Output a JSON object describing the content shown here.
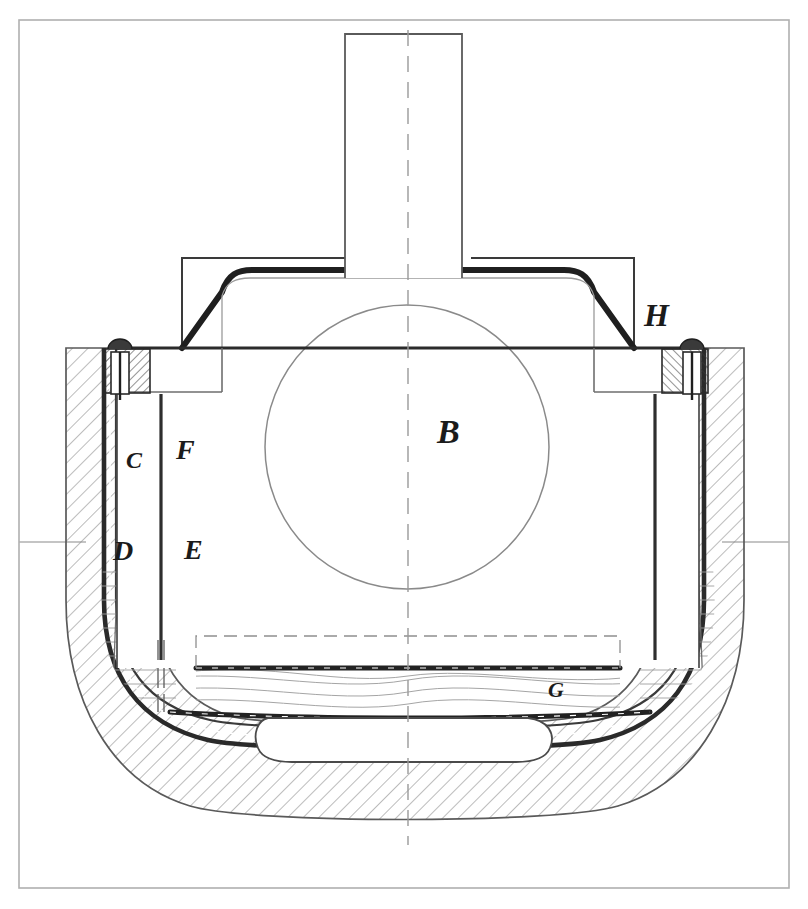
{
  "figure": {
    "kind": "engineering-sectional-drawing",
    "width": 808,
    "height": 909,
    "background_color": "#ffffff",
    "ink_color": "#1b1b1b",
    "light_ink_color": "#8c8c8c",
    "hatch_color": "#7a7a7a"
  },
  "border": {
    "name": "drawing-frame",
    "left": 19,
    "top": 20,
    "right": 789,
    "bottom": 888,
    "stroke": "#a8a8a8",
    "stroke_width": 1.6
  },
  "edge_ticks": [
    {
      "name": "left-edge-tick",
      "x1": 19,
      "y1": 542,
      "x2": 86,
      "y2": 542
    },
    {
      "name": "right-edge-tick",
      "x1": 722,
      "y1": 542,
      "x2": 789,
      "y2": 542
    }
  ],
  "centerline": {
    "name": "vertical-centerline",
    "x": 408,
    "y_top": 30,
    "y_bottom": 840,
    "dash": "14 9",
    "stroke": "#9a9a9a"
  },
  "callouts": [
    {
      "id": "B",
      "label": "B",
      "x": 437,
      "y": 443,
      "size": 34,
      "name": "callout-b-body"
    },
    {
      "id": "C",
      "label": "C",
      "x": 126,
      "y": 468,
      "size": 24,
      "name": "callout-c-lining"
    },
    {
      "id": "F",
      "label": "F",
      "x": 176,
      "y": 459,
      "size": 28,
      "name": "callout-f-plate"
    },
    {
      "id": "D",
      "label": "D",
      "x": 120,
      "y": 560,
      "size": 28,
      "name": "callout-d-wall"
    },
    {
      "id": "E",
      "label": "E",
      "x": 190,
      "y": 559,
      "size": 28,
      "name": "callout-e-chamber"
    },
    {
      "id": "G",
      "label": "G",
      "x": 555,
      "y": 695,
      "size": 22,
      "name": "callout-g-floor"
    },
    {
      "id": "H",
      "label": "H",
      "x": 646,
      "y": 324,
      "size": 32,
      "name": "callout-h-flange"
    }
  ],
  "geometry": {
    "shaft": {
      "name": "upper-shaft",
      "left": 345,
      "top": 34,
      "right": 462,
      "bottom": 280
    },
    "lid": {
      "name": "lid-cover",
      "top_y": 270,
      "left_shoulder_x": 222,
      "right_shoulder_x": 594,
      "left_skirt_x": 182,
      "right_skirt_x": 634,
      "skirt_bottom_y": 348,
      "bracket_top_y": 258
    },
    "inner_body": {
      "name": "inner-body-block",
      "left": 117,
      "right": 699,
      "top": 348,
      "bottom": 668
    },
    "circle": {
      "name": "body-circle",
      "cx": 407,
      "cy": 447,
      "r": 142
    },
    "outer_shell": {
      "name": "outer-vessel-shell",
      "top_left_x": 66,
      "top_right_x": 744,
      "top_y": 348,
      "bottom_y": 812,
      "corner_radius": 150
    },
    "bottom_cavity": {
      "name": "bottom-recess-cavity",
      "left": 268,
      "right": 548,
      "top": 726,
      "bottom": 760
    },
    "bolts": [
      {
        "name": "left-bolt",
        "cx": 120,
        "cy": 349
      },
      {
        "name": "right-bolt",
        "cx": 692,
        "cy": 349
      }
    ]
  }
}
